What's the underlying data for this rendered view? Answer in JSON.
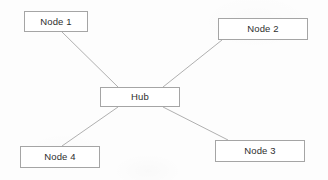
{
  "diagram": {
    "type": "star-topology-network-diagram",
    "background_color": "#fdfdfd",
    "node_border_color": "#a5a5a5",
    "node_fill_color": "#ffffff",
    "edge_color": "#b0b0b0",
    "label_color": "#2e2e2e",
    "nodes": [
      {
        "id": "node1",
        "label": "Node 1",
        "x": 24,
        "y": 11,
        "w": 64,
        "h": 21
      },
      {
        "id": "node2",
        "label": "Node 2",
        "x": 218,
        "y": 18,
        "w": 90,
        "h": 22
      },
      {
        "id": "hub",
        "label": "Hub",
        "x": 100,
        "y": 87,
        "w": 80,
        "h": 20
      },
      {
        "id": "node3",
        "label": "Node 3",
        "x": 215,
        "y": 140,
        "w": 90,
        "h": 22
      },
      {
        "id": "node4",
        "label": "Node 4",
        "x": 20,
        "y": 146,
        "w": 80,
        "h": 22
      }
    ],
    "edges": [
      {
        "id": "edge-hub-node1",
        "from": "hub",
        "to": "node1",
        "x1": 118,
        "y1": 87,
        "x2": 62,
        "y2": 32
      },
      {
        "id": "edge-hub-node2",
        "from": "hub",
        "to": "node2",
        "x1": 163,
        "y1": 87,
        "x2": 222,
        "y2": 40
      },
      {
        "id": "edge-hub-node3",
        "from": "hub",
        "to": "node3",
        "x1": 163,
        "y1": 107,
        "x2": 228,
        "y2": 140
      },
      {
        "id": "edge-hub-node4",
        "from": "hub",
        "to": "node4",
        "x1": 118,
        "y1": 107,
        "x2": 62,
        "y2": 146
      }
    ]
  }
}
